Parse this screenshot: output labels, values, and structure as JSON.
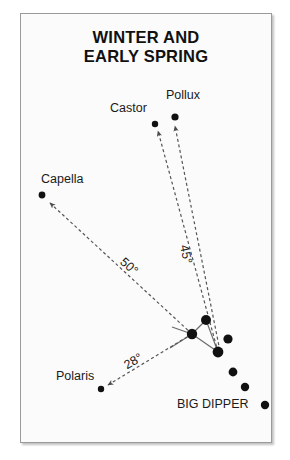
{
  "title": {
    "line1": "WINTER AND",
    "line2": "EARLY SPRING"
  },
  "labels": {
    "castor": "Castor",
    "pollux": "Pollux",
    "capella": "Capella",
    "polaris": "Polaris",
    "big_dipper": "BIG DIPPER"
  },
  "angles": {
    "to_pollux": "45°",
    "to_capella": "50°",
    "to_polaris": "28°"
  },
  "colors": {
    "background": "#fbfbfb",
    "page": "#ffffff",
    "frame_border": "#9a9a9a",
    "star": "#111111",
    "guide_line": "#555555",
    "dipper_line": "#6a6a6a",
    "text": "#1a1a1a"
  },
  "chart_data": {
    "type": "scatter",
    "title": "WINTER AND EARLY SPRING",
    "xlabel": "",
    "ylabel": "",
    "grid": false,
    "legend": null,
    "stars": [
      {
        "name": "Castor",
        "x": 155,
        "y": 124,
        "r": 3.2,
        "labeled": true
      },
      {
        "name": "Pollux",
        "x": 175,
        "y": 117,
        "r": 3.6,
        "labeled": true
      },
      {
        "name": "Capella",
        "x": 42,
        "y": 195,
        "r": 3.4,
        "labeled": true
      },
      {
        "name": "Polaris",
        "x": 101,
        "y": 389,
        "r": 3.2,
        "labeled": true
      },
      {
        "name": "Dipper hub",
        "x": 192,
        "y": 334,
        "r": 5.2,
        "labeled": false
      },
      {
        "name": "Dipper upper",
        "x": 206,
        "y": 320,
        "r": 5.0,
        "labeled": false
      },
      {
        "name": "Dipper right",
        "x": 228,
        "y": 339,
        "r": 4.6,
        "labeled": false
      },
      {
        "name": "Dipper lower",
        "x": 218,
        "y": 352,
        "r": 5.4,
        "labeled": false
      },
      {
        "name": "Dipper handle 1",
        "x": 233,
        "y": 372,
        "r": 4.4,
        "labeled": false
      },
      {
        "name": "Dipper handle 2",
        "x": 245,
        "y": 387,
        "r": 4.2,
        "labeled": false
      },
      {
        "name": "Dipper handle 3",
        "x": 265,
        "y": 405,
        "r": 4.2,
        "labeled": false
      }
    ],
    "pointer_lines": [
      {
        "from": "Dipper lower",
        "to": "Castor",
        "angle": "45°",
        "style": "dashed",
        "arrow": true,
        "x1": 218,
        "y1": 352,
        "x2": 158,
        "y2": 131
      },
      {
        "from": "Dipper lower",
        "to": "Pollux",
        "angle": "45°",
        "style": "dashed",
        "arrow": true,
        "x1": 221,
        "y1": 356,
        "x2": 175,
        "y2": 126
      },
      {
        "from": "Dipper hub",
        "to": "Capella",
        "angle": "50°",
        "style": "dashed",
        "arrow": true,
        "x1": 192,
        "y1": 334,
        "x2": 50,
        "y2": 203
      },
      {
        "from": "Dipper hub",
        "to": "Polaris",
        "angle": "28°",
        "style": "dashed",
        "arrow": true,
        "x1": 192,
        "y1": 334,
        "x2": 108,
        "y2": 385
      }
    ],
    "constellation_lines": [
      {
        "x1": 192,
        "y1": 334,
        "x2": 206,
        "y2": 320
      },
      {
        "x1": 192,
        "y1": 334,
        "x2": 218,
        "y2": 352
      },
      {
        "x1": 206,
        "y1": 320,
        "x2": 218,
        "y2": 352
      },
      {
        "x1": 192,
        "y1": 334,
        "x2": 172,
        "y2": 327
      },
      {
        "x1": 192,
        "y1": 334,
        "x2": 170,
        "y2": 348
      }
    ]
  }
}
